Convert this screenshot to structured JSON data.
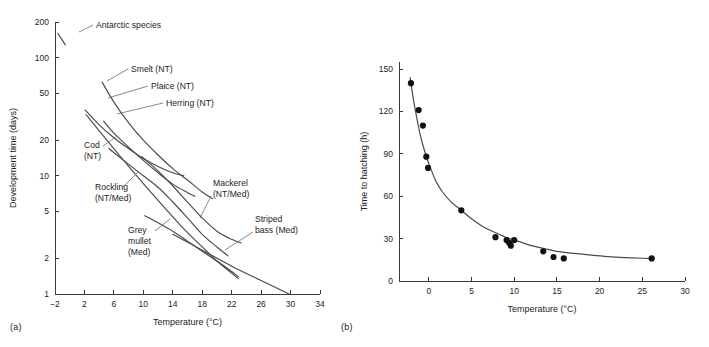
{
  "figure": {
    "panel_a_caption": "(a)",
    "panel_b_caption": "(b)"
  },
  "chart_data": [
    {
      "panel": "(a)",
      "type": "line",
      "title": "",
      "xlabel": "Temperature (°C)",
      "ylabel": "Development time (days)",
      "xlim": [
        -2,
        34
      ],
      "ylim": [
        1,
        200
      ],
      "yscale": "log",
      "xscale": "linear",
      "grid": false,
      "legend_position": "inline-annotations",
      "xticks": [
        -2,
        2,
        6,
        10,
        14,
        18,
        22,
        26,
        30,
        34
      ],
      "xticklabels": [
        "−2",
        "2",
        "6",
        "10",
        "14",
        "18",
        "22",
        "26",
        "30",
        "34"
      ],
      "yticks": [
        1,
        2,
        5,
        10,
        20,
        50,
        100,
        200
      ],
      "yticklabels": [
        "1",
        "2",
        "5",
        "10",
        "20",
        "50",
        "100",
        "200"
      ],
      "annotations": [
        "Antarctic species",
        "Smelt (NT)",
        "Plaice (NT)",
        "Herring (NT)",
        "Cod (NT)",
        "Rockling (NT/Med)",
        "Mackerel (NT/Med)",
        "Grey mullet (Med)",
        "Striped bass (Med)"
      ],
      "series": [
        {
          "name": "Antarctic species",
          "label": "Antarctic species",
          "label_lines": [
            "Antarctic species"
          ],
          "points": [
            [
              -1.6,
              160
            ],
            [
              -0.6,
              128
            ]
          ]
        },
        {
          "name": "Smelt (NT)",
          "label": "Smelt (NT)",
          "label_lines": [
            "Smelt (NT)"
          ],
          "points": [
            [
              4.4,
              62
            ],
            [
              6,
              42
            ],
            [
              8,
              28
            ],
            [
              10,
              20
            ],
            [
              12,
              15
            ],
            [
              14,
              11.5
            ],
            [
              16,
              9.2
            ],
            [
              18,
              7.3
            ],
            [
              19.4,
              6.4
            ]
          ]
        },
        {
          "name": "Plaice (NT)",
          "label": "Plaice (NT)",
          "label_lines": [
            "Plaice (NT)"
          ],
          "points": [
            [
              2.1,
              36
            ],
            [
              4,
              27
            ],
            [
              6,
              21
            ],
            [
              8,
              17
            ],
            [
              10,
              14
            ],
            [
              12,
              12
            ],
            [
              14,
              10.6
            ],
            [
              15.5,
              10.0
            ]
          ]
        },
        {
          "name": "Herring (NT)",
          "label": "Herring (NT)",
          "label_lines": [
            "Herring (NT)"
          ],
          "points": [
            [
              4.6,
              29
            ],
            [
              6,
              23
            ],
            [
              8,
              17.5
            ],
            [
              10,
              13.5
            ],
            [
              12,
              10.6
            ],
            [
              14,
              8.5
            ],
            [
              16,
              7.2
            ],
            [
              17,
              6.7
            ]
          ]
        },
        {
          "name": "Cod (NT)",
          "label": "Cod (NT)",
          "label_lines": [
            "Cod",
            "(NT)"
          ],
          "points": [
            [
              2.2,
              33
            ],
            [
              4,
              24
            ],
            [
              6,
              17
            ],
            [
              8,
              12
            ],
            [
              10,
              8.6
            ],
            [
              12,
              6.2
            ],
            [
              14,
              4.5
            ],
            [
              16,
              3.3
            ],
            [
              18,
              2.5
            ],
            [
              20,
              1.9
            ],
            [
              22,
              1.5
            ],
            [
              22.9,
              1.35
            ]
          ]
        },
        {
          "name": "Rockling (NT/Med)",
          "label": "Rockling (NT/Med)",
          "label_lines": [
            "Rockling",
            "(NT/Med)"
          ],
          "points": [
            [
              5.3,
              17
            ],
            [
              8,
              12.5
            ],
            [
              10,
              10
            ],
            [
              12,
              8.0
            ],
            [
              14,
              6.0
            ],
            [
              16,
              4.4
            ],
            [
              18,
              3.2
            ],
            [
              20,
              2.5
            ],
            [
              21.5,
              2.1
            ]
          ]
        },
        {
          "name": "Mackerel (NT/Med)",
          "label": "Mackerel (NT/Med)",
          "label_lines": [
            "Mackerel",
            "(NT/Med)"
          ],
          "points": [
            [
              9.8,
              14.5
            ],
            [
              12,
              11
            ],
            [
              14,
              8.2
            ],
            [
              16,
              6.0
            ],
            [
              18,
              4.4
            ],
            [
              20,
              3.4
            ],
            [
              22,
              2.9
            ],
            [
              23.3,
              2.7
            ]
          ]
        },
        {
          "name": "Grey mullet (Med)",
          "label": "Grey mullet (Med)",
          "label_lines": [
            "Grey",
            "mullet",
            "(Med)"
          ],
          "points": [
            [
              10.2,
              4.6
            ],
            [
              12,
              4.0
            ],
            [
              14,
              3.4
            ],
            [
              16,
              2.8
            ],
            [
              18,
              2.3
            ],
            [
              20,
              1.9
            ],
            [
              22,
              1.55
            ],
            [
              22.9,
              1.4
            ]
          ]
        },
        {
          "name": "Striped bass (Med)",
          "label": "Striped bass (Med)",
          "label_lines": [
            "Striped",
            "bass (Med)"
          ],
          "points": [
            [
              14.0,
              3.2
            ],
            [
              18,
              2.35
            ],
            [
              22,
              1.72
            ],
            [
              26,
              1.3
            ],
            [
              29.8,
              1.0
            ]
          ]
        }
      ]
    },
    {
      "panel": "(b)",
      "type": "scatter",
      "title": "",
      "xlabel": "Temperature (°C)",
      "ylabel": "Time to hatching (h)",
      "xlim": [
        -3.5,
        30
      ],
      "ylim": [
        0,
        155
      ],
      "yscale": "linear",
      "xscale": "linear",
      "grid": false,
      "legend_position": "none",
      "xticks": [
        0,
        5,
        10,
        15,
        20,
        25,
        30
      ],
      "xticklabels": [
        "0",
        "5",
        "10",
        "15",
        "20",
        "25",
        "30"
      ],
      "yticks": [
        0,
        30,
        60,
        90,
        120,
        150
      ],
      "yticklabels": [
        "0",
        "30",
        "60",
        "90",
        "120",
        "150"
      ],
      "points": [
        [
          -2.1,
          140
        ],
        [
          -1.2,
          121
        ],
        [
          -0.7,
          110
        ],
        [
          -0.3,
          88
        ],
        [
          -0.1,
          80
        ],
        [
          3.8,
          50
        ],
        [
          7.8,
          31
        ],
        [
          9.1,
          29
        ],
        [
          9.4,
          27
        ],
        [
          9.6,
          25
        ],
        [
          10.0,
          29
        ],
        [
          13.4,
          21
        ],
        [
          14.6,
          17
        ],
        [
          15.8,
          16
        ],
        [
          26.1,
          16
        ]
      ],
      "fit_curve": [
        [
          -2.2,
          144
        ],
        [
          -1.8,
          128
        ],
        [
          -1.4,
          115
        ],
        [
          -1.0,
          103
        ],
        [
          -0.5,
          92
        ],
        [
          0.0,
          83
        ],
        [
          0.8,
          71
        ],
        [
          1.6,
          63
        ],
        [
          2.6,
          56
        ],
        [
          3.8,
          50
        ],
        [
          5.0,
          44
        ],
        [
          6.2,
          39
        ],
        [
          7.5,
          35
        ],
        [
          9.0,
          31
        ],
        [
          10.5,
          28
        ],
        [
          12.0,
          25
        ],
        [
          13.5,
          23
        ],
        [
          15.0,
          21
        ],
        [
          17.0,
          19.5
        ],
        [
          19.0,
          18.3
        ],
        [
          21.0,
          17.3
        ],
        [
          23.0,
          16.6
        ],
        [
          25.0,
          16.1
        ],
        [
          26.3,
          15.8
        ]
      ]
    }
  ]
}
